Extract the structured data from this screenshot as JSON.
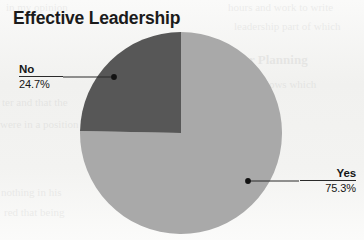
{
  "chart_data": {
    "type": "pie",
    "title": "Effective Leadership",
    "labels": [
      "Yes",
      "No"
    ],
    "values": [
      75.3,
      24.7
    ],
    "value_labels": [
      "75.3%",
      "24.7%"
    ],
    "units": "percent",
    "colors": [
      "#a9a9a9",
      "#575757"
    ],
    "start_angle_deg": 0,
    "direction": "counterclockwise",
    "legend": "none",
    "labels_position": "callout-outside",
    "grid": false,
    "slices": [
      {
        "name": "Yes",
        "value": 75.3,
        "value_label": "75.3%",
        "color": "#a9a9a9",
        "callout_side": "right"
      },
      {
        "name": "No",
        "value": 24.7,
        "value_label": "24.7%",
        "color": "#575757",
        "callout_side": "left"
      }
    ]
  },
  "figure": {
    "title": "Effective Leadership",
    "background_color": "#f3f3f1",
    "callouts": {
      "no": {
        "name": "No",
        "percent": "24.7%"
      },
      "yes": {
        "name": "Yes",
        "percent": "75.3%"
      }
    }
  },
  "background_ghost_text": {
    "lines": [
      "in my opinion",
      "hours and work to write",
      "leadership part of which",
      "der Planning",
      "e follows which",
      "ter and that the",
      "were in a position",
      "nothing in his",
      "red that being"
    ]
  }
}
